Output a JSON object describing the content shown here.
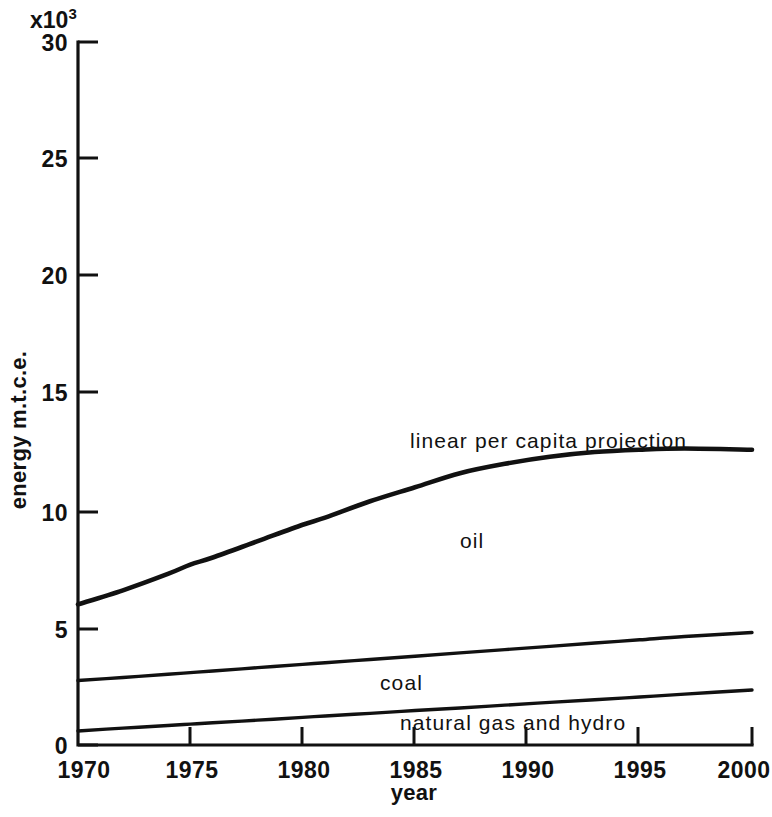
{
  "chart_data": {
    "type": "line",
    "title": "",
    "subtitle": "",
    "xlabel": "year",
    "ylabel": "energy m.t.c.e.",
    "y_multiplier": "x10",
    "y_multiplier_exponent": "3",
    "xlim": [
      1970,
      2000
    ],
    "ylim": [
      0,
      30
    ],
    "x_ticks": [
      1970,
      1975,
      1980,
      1985,
      1990,
      1995,
      2000
    ],
    "x_tick_labels": [
      "1970",
      "1975",
      "1980",
      "1985",
      "1990",
      "1995",
      "2000"
    ],
    "y_ticks": [
      0,
      5,
      10,
      15,
      20,
      25,
      30
    ],
    "y_tick_labels": [
      "0",
      "5",
      "10",
      "15",
      "20",
      "25",
      "30"
    ],
    "grid": false,
    "legend_position": "inline-annotations",
    "x": [
      1970,
      1972,
      1974,
      1975,
      1976,
      1978,
      1980,
      1981,
      1983,
      1985,
      1987,
      1989,
      1991,
      1993,
      1995,
      1997,
      2000
    ],
    "series": [
      {
        "name": "linear per capita projection",
        "annotation": "linear per capita projection",
        "annotation_x": 1986,
        "annotation_y": 12.9,
        "values": [
          6.0,
          6.6,
          7.3,
          7.7,
          8.0,
          8.7,
          9.4,
          9.7,
          10.4,
          11.0,
          11.6,
          12.0,
          12.3,
          12.5,
          12.6,
          12.65,
          12.6
        ]
      },
      {
        "name": "coal",
        "annotation": "coal",
        "annotation_x": 1984,
        "annotation_y": 3.55,
        "values": [
          2.75,
          2.88,
          3.02,
          3.09,
          3.16,
          3.3,
          3.44,
          3.51,
          3.65,
          3.79,
          3.93,
          4.07,
          4.21,
          4.35,
          4.49,
          4.63,
          4.8
        ]
      },
      {
        "name": "natural gas and hydro",
        "annotation": "natural gas and hydro",
        "annotation_x": 1986,
        "annotation_y": 1.0,
        "values": [
          0.6,
          0.72,
          0.83,
          0.89,
          0.95,
          1.06,
          1.18,
          1.24,
          1.35,
          1.47,
          1.58,
          1.7,
          1.82,
          1.93,
          2.05,
          2.17,
          2.35
        ]
      }
    ],
    "annotations": [
      {
        "text": "linear per capita projection",
        "x": 1986,
        "y": 12.9
      },
      {
        "text": "oil",
        "x": 1984,
        "y": 7.4
      },
      {
        "text": "coal",
        "x": 1984,
        "y": 3.55
      },
      {
        "text": "natural gas and hydro",
        "x": 1986,
        "y": 1.0
      }
    ],
    "colors": {
      "line": "#111111",
      "background": "#ffffff",
      "axis": "#111111"
    }
  }
}
